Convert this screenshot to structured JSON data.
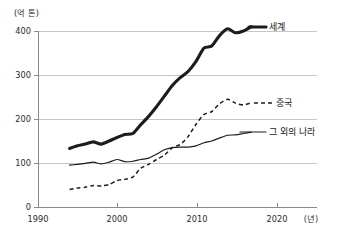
{
  "chart_data": {
    "type": "line",
    "title": "",
    "subtitle": "",
    "unit_label": "(억 톤)",
    "xlabel": "(년)",
    "ylabel": "",
    "xlim": [
      1990,
      2023
    ],
    "ylim": [
      0,
      430
    ],
    "grid": true,
    "grid_axis": "y",
    "legend_position": "inline-right",
    "x_ticks": [
      1990,
      2000,
      2010,
      2020
    ],
    "x_tick_labels": [
      "1990",
      "2000",
      "2010",
      "2020"
    ],
    "y_ticks": [
      0,
      100,
      200,
      300,
      400
    ],
    "y_tick_labels": [
      "0",
      "100",
      "200",
      "300",
      "400"
    ],
    "x": [
      1994,
      1995,
      1996,
      1997,
      1998,
      1999,
      2000,
      2001,
      2002,
      2003,
      2004,
      2005,
      2006,
      2007,
      2008,
      2009,
      2010,
      2011,
      2012,
      2013,
      2014,
      2015,
      2016,
      2017
    ],
    "series": [
      {
        "name": "세계",
        "label": "세계",
        "style": "thick-solid",
        "values": [
          133,
          139,
          143,
          148,
          143,
          150,
          158,
          165,
          167,
          187,
          206,
          228,
          252,
          276,
          294,
          308,
          331,
          361,
          366,
          390,
          405,
          396,
          400,
          410
        ]
      },
      {
        "name": "중국",
        "label": "중국",
        "style": "dashed",
        "values": [
          40,
          43,
          45,
          49,
          48,
          51,
          60,
          63,
          68,
          88,
          97,
          108,
          118,
          135,
          142,
          160,
          188,
          210,
          217,
          235,
          245,
          236,
          232,
          237
        ]
      },
      {
        "name": "그 외의 나라",
        "label": "그 외의 나라",
        "style": "thin-solid",
        "values": [
          95,
          97,
          99,
          102,
          98,
          102,
          108,
          103,
          104,
          108,
          111,
          120,
          130,
          135,
          136,
          136,
          139,
          146,
          150,
          157,
          163,
          164,
          167,
          170
        ]
      }
    ]
  }
}
